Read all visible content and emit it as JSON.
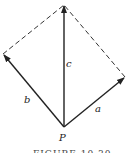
{
  "diagram": {
    "type": "vector-parallelogram",
    "origin_label": "P",
    "vectors": [
      {
        "name": "a",
        "label": "a",
        "style": "solid-arrow",
        "from": [
          64,
          127
        ],
        "to": [
          125,
          77
        ]
      },
      {
        "name": "b",
        "label": "b",
        "style": "solid-arrow",
        "from": [
          64,
          127
        ],
        "to": [
          3,
          54
        ]
      },
      {
        "name": "c",
        "label": "c",
        "style": "solid-arrow",
        "from": [
          64,
          127
        ],
        "to": [
          64,
          5
        ]
      }
    ],
    "dashed_edges": [
      {
        "from": [
          3,
          54
        ],
        "to": [
          64,
          5
        ]
      },
      {
        "from": [
          125,
          77
        ],
        "to": [
          64,
          5
        ]
      }
    ],
    "caption": "FIGURE 10.30",
    "colors": {
      "stroke": "#222222",
      "background": "#ffffff"
    }
  }
}
